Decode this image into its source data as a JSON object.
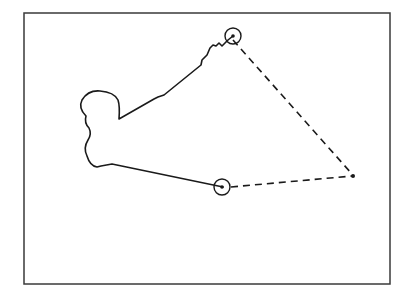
{
  "figure": {
    "frame": {
      "x": 24,
      "y": 13,
      "width": 366,
      "height": 271,
      "stroke": "#3a3a3a"
    },
    "trajectory": {
      "stroke": "#1a1a1a",
      "path": "M223,187 L112,164 L101,166 L97,167 Q90,166 87,156 Q83,148 88,140 Q92,134 89,128 Q84,123 86,116 Q78,108 82,100 Q88,90 100,91 Q114,92 118,100 Q120,106 119,119 L154,99 L158,97 L164,95 L201,65 L202,60 L207,55 L210,48 L213,45 L216,46 L219,43 L222,46 L228,40 L233,36"
    },
    "start_marker": {
      "cx": 222,
      "cy": 187,
      "r": 8,
      "dot_r": 1.8
    },
    "end_marker": {
      "cx": 233,
      "cy": 36,
      "r": 8,
      "dot_r": 1.8
    },
    "convergence_point": {
      "cx": 353,
      "cy": 176,
      "r": 2
    },
    "dashed_lines": [
      {
        "x1": 233,
        "y1": 40,
        "x2": 352,
        "y2": 174
      },
      {
        "x1": 231,
        "y1": 187,
        "x2": 352,
        "y2": 176
      }
    ],
    "dash_pattern": "7,5"
  }
}
